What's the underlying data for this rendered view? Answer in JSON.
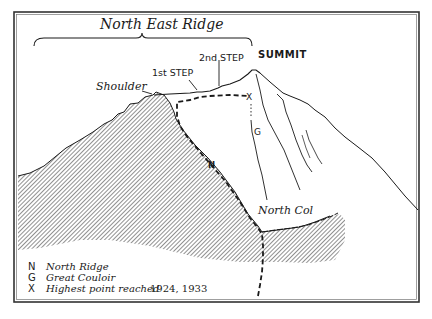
{
  "diagram": {
    "title": "North East Ridge",
    "labels": {
      "summit": "SUMMIT",
      "second_step": "2nd STEP",
      "first_step": "1st STEP",
      "shoulder": "Shoulder",
      "north_col": "North Col",
      "route_n": "N",
      "route_g": "G",
      "marker_x": "X"
    },
    "colors": {
      "ink": "#1a1a1a",
      "hatch": "#555555",
      "background": "#ffffff",
      "frame": "#333333"
    }
  },
  "legend": {
    "items": [
      {
        "key": "N",
        "text": "North Ridge",
        "suffix": ""
      },
      {
        "key": "G",
        "text": "Great Couloir",
        "suffix": ""
      },
      {
        "key": "X",
        "text": "Highest point reached",
        "suffix": "1924, 1933"
      }
    ]
  }
}
